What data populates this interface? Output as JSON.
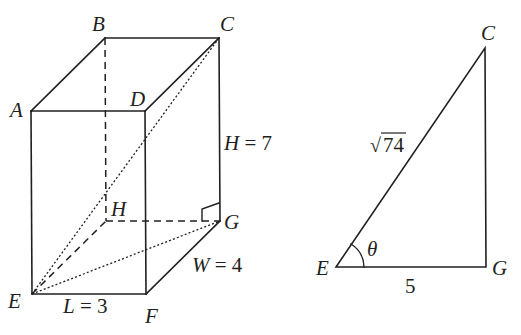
{
  "prism": {
    "vertices": {
      "A": {
        "label": "A",
        "x": 31,
        "y": 111
      },
      "B": {
        "label": "B",
        "x": 105,
        "y": 38
      },
      "C": {
        "label": "C",
        "x": 219,
        "y": 38
      },
      "D": {
        "label": "D",
        "x": 145,
        "y": 111
      },
      "E": {
        "label": "E",
        "x": 32,
        "y": 294
      },
      "F": {
        "label": "F",
        "x": 146,
        "y": 294
      },
      "G": {
        "label": "G",
        "x": 220,
        "y": 221
      },
      "H": {
        "label": "H",
        "x": 106,
        "y": 221
      }
    },
    "dimensions": {
      "height": {
        "var": "H",
        "eq": " = ",
        "value": "7"
      },
      "width": {
        "var": "W",
        "eq": " = ",
        "value": "4"
      },
      "length": {
        "var": "L",
        "eq": " = ",
        "value": "3"
      }
    },
    "visible_edges": [
      "AB",
      "BC",
      "AD",
      "DC",
      "AE",
      "DF",
      "CG",
      "EF",
      "FG"
    ],
    "hidden_edges": [
      "BH",
      "HG",
      "EH"
    ],
    "diagonals": [
      "EC",
      "EG"
    ],
    "right_angle_at": "G"
  },
  "triangle": {
    "vertices": {
      "E": {
        "label": "E",
        "x": 336,
        "y": 267
      },
      "G": {
        "label": "G",
        "x": 486,
        "y": 267
      },
      "C": {
        "label": "C",
        "x": 485,
        "y": 48
      }
    },
    "hypotenuse_label": "74",
    "hypotenuse_prefix": "√",
    "base_label": "5",
    "angle_label": "θ"
  }
}
